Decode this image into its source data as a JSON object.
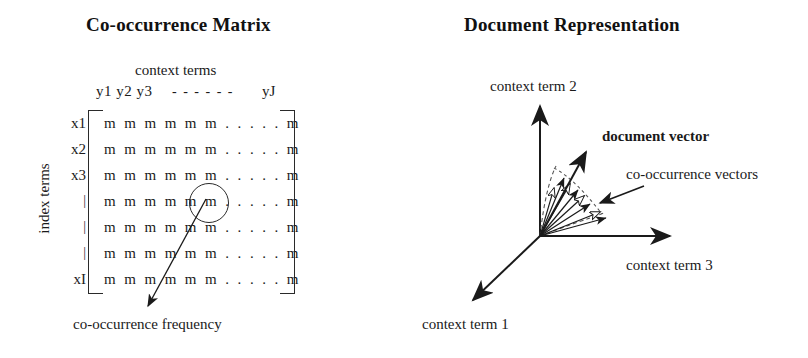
{
  "figure": {
    "panels": [
      {
        "id": "co-occurrence-matrix",
        "title": "Co-occurrence Matrix"
      },
      {
        "id": "document-representation",
        "title": "Document Representation"
      }
    ]
  },
  "matrix": {
    "title": "Co-occurrence Matrix",
    "column_axis_label": "context terms",
    "row_axis_label": "index terms",
    "column_headers_left": "y1 y2 y3",
    "column_headers_dashes": "- - - - - -",
    "column_headers_right": "yJ",
    "row_headers": [
      "x1",
      "x2",
      "x3",
      "|",
      "|",
      "|",
      "xI"
    ],
    "cell_row": "m m m m m m . . . . . m",
    "rows": [
      "m m m m m m . . . . . m",
      "m m m m m m . . . . . m",
      "m m m m m m . . . . . m",
      "m m m m m m . . . . . m",
      "m m m m m m . . . . . m",
      "m m m m m m . . . . . m",
      "m m m m m m . . . . . m"
    ],
    "annotation_caption": "co-occurrence frequency",
    "highlight": {
      "shape": "circle",
      "target_row": 4,
      "target_col": 6
    }
  },
  "vectors": {
    "title": "Document Representation",
    "axis_labels": {
      "axis_1": "context term 1",
      "axis_2": "context term 2",
      "axis_3": "context term 3"
    },
    "annotations": {
      "document_vector": "document vector",
      "co_occurrence_vectors": "co-occurrence vectors"
    }
  },
  "colors": {
    "ink": "#1a1a1a",
    "stroke": "#2a2a2a",
    "background": "#ffffff",
    "dashed": "#555555"
  }
}
